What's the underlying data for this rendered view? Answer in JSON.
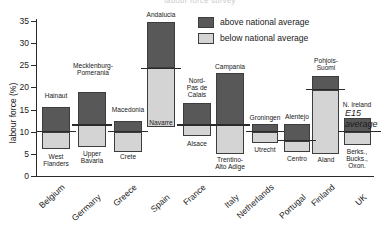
{
  "title": "labour force survey",
  "axes": {
    "ylabel": "labour force (%)",
    "yticks": [
      "0",
      "5",
      "10",
      "15",
      "20",
      "25",
      "30",
      "35"
    ],
    "ymin": 0,
    "ymax": 35
  },
  "legend": {
    "above_label": "above national average",
    "below_label": "below national average",
    "above_color": "#585858",
    "below_color": "#d4d4d4"
  },
  "reference": {
    "label_line1": "E15",
    "label_line2": "average"
  },
  "countries": [
    "Belgium",
    "Germany",
    "Greece",
    "Spain",
    "France",
    "Italy",
    "Netherlands",
    "Portugal",
    "Finland",
    "UK"
  ],
  "chart_data": {
    "type": "bar",
    "title": "labour force survey",
    "xlabel": "",
    "ylabel": "labour force (%)",
    "ylim": [
      0,
      35
    ],
    "grid": false,
    "legend_position": "top-right",
    "categories": [
      "Belgium",
      "Germany",
      "Greece",
      "Spain",
      "France",
      "Italy",
      "Netherlands",
      "Portugal",
      "Finland",
      "UK"
    ],
    "series": [
      {
        "name": "above national average",
        "color": "#585858",
        "regions": [
          "Hainaut",
          "Mecklenburg-Pomerania",
          "Macedonia",
          "Andalucia",
          "Nord-Pas de Calais",
          "Campania",
          "Groningen",
          "Alentejo",
          "Pohjois-Suomi",
          "N. Ireland"
        ],
        "top_values": [
          15.5,
          19.0,
          12.5,
          34.7,
          16.5,
          23.2,
          11.7,
          11.8,
          22.5,
          13.0
        ]
      },
      {
        "name": "below national average",
        "color": "#d4d4d4",
        "regions": [
          "West Flanders",
          "Upper Bavaria",
          "Crete",
          "Navarre",
          "Alsace",
          "Trentino-Alto Adige",
          "Utrecht",
          "Centro",
          "Aland",
          "Berks., Bucks., Oxon."
        ],
        "bottom_values": [
          6.0,
          6.5,
          5.5,
          11.0,
          9.0,
          5.0,
          7.5,
          5.5,
          5.0,
          7.0
        ]
      }
    ],
    "national_average_split": [
      10.0,
      11.5,
      10.0,
      24.3,
      11.5,
      11.5,
      10.0,
      8.0,
      19.5,
      10.0
    ],
    "e15_average_level": 11.5
  },
  "bars": [
    {
      "country": "Belgium",
      "x": 42,
      "width": 28,
      "top": 15.5,
      "split": 10.0,
      "bottom": 6.0,
      "above_region": "Hainaut",
      "below_region": "West\nFlanders",
      "above_label_x": 40,
      "above_label_y": 92,
      "above_label_w": 32,
      "below_label_x": 40,
      "below_label_y": 153,
      "below_label_w": 32
    },
    {
      "country": "Germany",
      "x": 78,
      "width": 28,
      "top": 19.0,
      "split": 11.5,
      "bottom": 6.5,
      "above_region": "Mecklenburg-\nPomerania",
      "below_region": "Upper\nBavaria",
      "above_label_x": 68,
      "above_label_y": 62,
      "above_label_w": 50,
      "below_label_x": 76,
      "below_label_y": 150,
      "below_label_w": 32
    },
    {
      "country": "Greece",
      "x": 114,
      "width": 28,
      "top": 12.5,
      "split": 10.0,
      "bottom": 5.5,
      "above_region": "Macedonia",
      "below_region": "Crete",
      "above_label_x": 104,
      "above_label_y": 106,
      "above_label_w": 48,
      "below_label_x": 112,
      "below_label_y": 153,
      "below_label_w": 32
    },
    {
      "country": "Spain",
      "x": 147,
      "width": 28,
      "top": 34.7,
      "split": 24.3,
      "bottom": 11.0,
      "above_region": "Andalucia",
      "below_region": "Navarre",
      "above_label_x": 137,
      "above_label_y": 11,
      "above_label_w": 48,
      "below_label_x": 137,
      "below_label_y": 119,
      "below_label_w": 48
    },
    {
      "country": "France",
      "x": 183,
      "width": 28,
      "top": 16.5,
      "split": 11.5,
      "bottom": 9.0,
      "above_region": "Nord-\nPas de\nCalais",
      "below_region": "Alsace",
      "above_label_x": 179,
      "above_label_y": 77,
      "above_label_w": 36,
      "below_label_x": 181,
      "below_label_y": 140,
      "below_label_w": 32
    },
    {
      "country": "Italy",
      "x": 216,
      "width": 28,
      "top": 23.2,
      "split": 11.5,
      "bottom": 5.0,
      "above_region": "Campania",
      "below_region": "Trentino-\nAlto Adige",
      "above_label_x": 206,
      "above_label_y": 63,
      "above_label_w": 48,
      "below_label_x": 206,
      "below_label_y": 156,
      "below_label_w": 48
    },
    {
      "country": "Netherlands",
      "x": 252,
      "width": 26,
      "top": 11.7,
      "split": 10.0,
      "bottom": 7.5,
      "above_region": "Groningen",
      "below_region": "Utrecht",
      "above_label_x": 241,
      "above_label_y": 114,
      "above_label_w": 48,
      "below_label_x": 241,
      "below_label_y": 146,
      "below_label_w": 48
    },
    {
      "country": "Portugal",
      "x": 284,
      "width": 26,
      "top": 11.8,
      "split": 8.0,
      "bottom": 5.5,
      "above_region": "Alentejo",
      "below_region": "Centro",
      "above_label_x": 273,
      "above_label_y": 113,
      "above_label_w": 48,
      "below_label_x": 273,
      "below_label_y": 155,
      "below_label_w": 48
    },
    {
      "country": "Finland",
      "x": 312,
      "width": 27,
      "top": 22.5,
      "split": 19.5,
      "bottom": 5.0,
      "above_region": "Pohjois-\nSuomi",
      "below_region": "Aland",
      "above_label_x": 304,
      "above_label_y": 57,
      "above_label_w": 44,
      "below_label_x": 304,
      "below_label_y": 156,
      "below_label_w": 44
    },
    {
      "country": "UK",
      "x": 344,
      "width": 27,
      "top": 13.0,
      "split": 10.0,
      "bottom": 7.0,
      "above_region": "N. Ireland",
      "below_region": "Berks.,\nBucks.,\nOxon.",
      "above_label_x": 332,
      "above_label_y": 101,
      "above_label_w": 50,
      "below_label_x": 335,
      "below_label_y": 148,
      "below_label_w": 44
    }
  ]
}
